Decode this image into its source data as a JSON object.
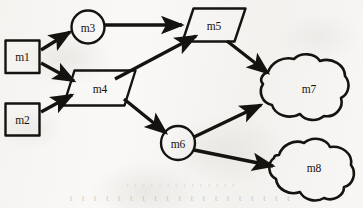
{
  "figure": {
    "kind": "flowchart-diagram",
    "background_color": "#f7f6f4",
    "ink_color": "#15130f",
    "width": 363,
    "height": 208
  },
  "nodes": [
    {
      "id": "m1",
      "label": "m1",
      "shape": "rectangle",
      "cx": 22,
      "cy": 56
    },
    {
      "id": "m2",
      "label": "m2",
      "shape": "rectangle",
      "cx": 22,
      "cy": 119
    },
    {
      "id": "m3",
      "label": "m3",
      "shape": "circle",
      "cx": 88,
      "cy": 27
    },
    {
      "id": "m4",
      "label": "m4",
      "shape": "parallelogram",
      "cx": 99,
      "cy": 88
    },
    {
      "id": "m5",
      "label": "m5",
      "shape": "parallelogram",
      "cx": 213,
      "cy": 25
    },
    {
      "id": "m6",
      "label": "m6",
      "shape": "circle",
      "cx": 178,
      "cy": 143
    },
    {
      "id": "m7",
      "label": "m7",
      "shape": "cloud",
      "cx": 309,
      "cy": 89
    },
    {
      "id": "m8",
      "label": "m8",
      "shape": "cloud",
      "cx": 313,
      "cy": 168
    }
  ],
  "edges": [
    {
      "id": "m1-m3",
      "from": "m1",
      "to": "m3"
    },
    {
      "id": "m1-m4",
      "from": "m1",
      "to": "m4"
    },
    {
      "id": "m2-m4",
      "from": "m2",
      "to": "m4"
    },
    {
      "id": "m3-m5",
      "from": "m3",
      "to": "m5"
    },
    {
      "id": "m4-m5",
      "from": "m4",
      "to": "m5"
    },
    {
      "id": "m4-m6",
      "from": "m4",
      "to": "m6"
    },
    {
      "id": "m5-m7",
      "from": "m5",
      "to": "m7"
    },
    {
      "id": "m6-m7",
      "from": "m6",
      "to": "m7"
    },
    {
      "id": "m6-m8",
      "from": "m6",
      "to": "m8"
    }
  ],
  "bleed_through": {
    "upper": "t t t    t t t t t t    t t t    t t",
    "lower": "t t t t    t t t t t t    t t t t    t t t t t"
  }
}
